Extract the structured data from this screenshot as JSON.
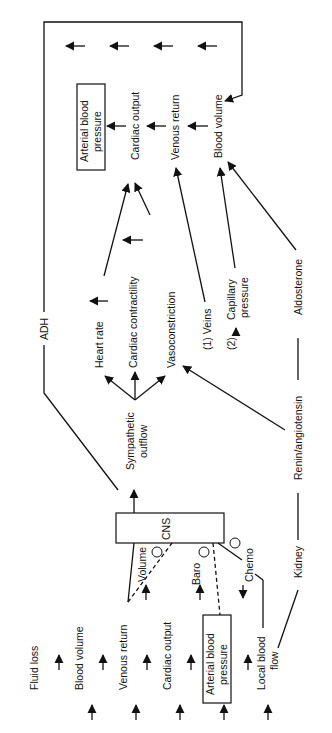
{
  "diagram": {
    "orientation": "rotated-90-ccw",
    "bottom_chain": [
      "Fluid loss",
      "Blood volume",
      "Venous return",
      "Cardiac output",
      "Arterial blood pressure",
      "Local blood flow"
    ],
    "top_chain": [
      "Blood volume",
      "Venous return",
      "Cardiac output",
      "Arterial blood pressure"
    ],
    "cns": "CNS",
    "receptors": {
      "volume": "Volume",
      "baro": "Baro",
      "chemo": "Chemo",
      "inhibit_symbol": "−"
    },
    "sympathetic": "Sympathetic outflow",
    "effects": {
      "heart_rate": "Heart rate",
      "contractility": "Cardiac contractility",
      "vasoconstriction": "Vasoconstriction"
    },
    "veins": "(1) Veins",
    "capillary": {
      "num": "(2)",
      "label1": "Capillary",
      "label2": "pressure"
    },
    "adh": "ADH",
    "kidney": "Kidney",
    "renin": "Renin/angiotensin",
    "aldosterone": "Aldosterone",
    "abp_line1": "Arterial blood",
    "abp_line2": "pressure",
    "lbf_line1": "Local blood",
    "lbf_line2": "flow",
    "symp_line1": "Sympathetic",
    "symp_line2": "outflow"
  }
}
